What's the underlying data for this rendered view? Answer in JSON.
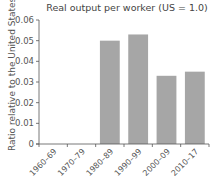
{
  "chart_data": {
    "type": "bar",
    "title": "Real output per worker (US = 1.0)",
    "xlabel": "",
    "ylabel": "Ratio relative to the United States",
    "categories": [
      "1960–69",
      "1970–79",
      "1980–89",
      "1990–99",
      "2000–09",
      "2010–17"
    ],
    "values": [
      null,
      null,
      0.05,
      0.053,
      0.033,
      0.035
    ],
    "ylim": [
      0,
      0.06
    ],
    "yticks": [
      "0",
      "0.01",
      "0.02",
      "0.03",
      "0.04",
      "0.05",
      "0.06"
    ],
    "grid": false,
    "legend": null,
    "bar_color": "#a6a6a6"
  }
}
